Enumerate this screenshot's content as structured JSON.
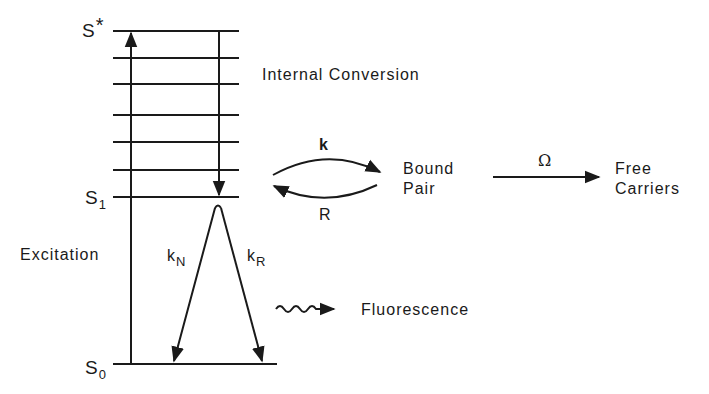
{
  "diagram": {
    "type": "energy-level (Jablonski) diagram",
    "states": {
      "s_star": {
        "symbol": "S",
        "superscript": "*"
      },
      "s1": {
        "symbol": "S",
        "subscript": "1"
      },
      "s0": {
        "symbol": "S",
        "subscript": "0"
      }
    },
    "labels": {
      "internal_conversion": "Internal Conversion",
      "excitation": "Excitation",
      "fluorescence": "Fluorescence",
      "bound_pair_line1": "Bound",
      "bound_pair_line2": "Pair",
      "free_carriers_line1": "Free",
      "free_carriers_line2": "Carriers"
    },
    "rates": {
      "k": "k",
      "R": "R",
      "omega": "Ω",
      "kN_base": "k",
      "kN_sub": "N",
      "kR_base": "k",
      "kR_sub": "R"
    },
    "vibrational_levels_count": 7,
    "line_color": "#1a1a1a"
  }
}
